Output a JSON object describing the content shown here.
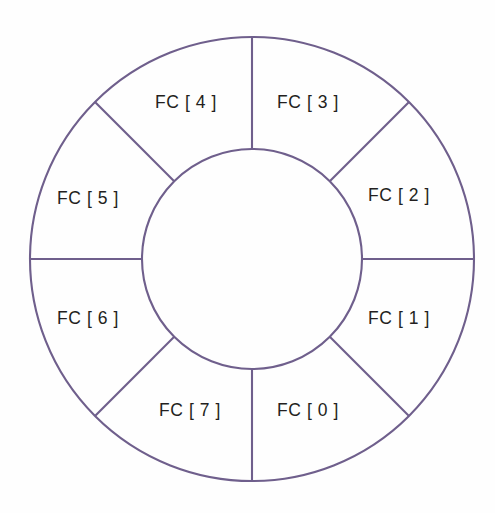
{
  "diagram": {
    "type": "annulus-segments",
    "title": "",
    "background_color": "#fefefe",
    "stroke_color": "#6f5f8c",
    "label_color": "#231f20",
    "outer_radius": 222,
    "inner_radius": 110,
    "center_x": 252,
    "center_y": 259,
    "segment_count": 8,
    "segments": [
      {
        "label": "FC [ 0 ]",
        "index": 0,
        "start_angle_deg": 270,
        "end_angle_deg": 315,
        "label_x": 308,
        "label_y": 411
      },
      {
        "label": "FC [ 1 ]",
        "index": 1,
        "start_angle_deg": 315,
        "end_angle_deg": 360,
        "label_x": 399,
        "label_y": 319
      },
      {
        "label": "FC [ 2 ]",
        "index": 2,
        "start_angle_deg": 0,
        "end_angle_deg": 45,
        "label_x": 399,
        "label_y": 196
      },
      {
        "label": "FC [ 3 ]",
        "index": 3,
        "start_angle_deg": 45,
        "end_angle_deg": 90,
        "label_x": 308,
        "label_y": 103
      },
      {
        "label": "FC [ 4 ]",
        "index": 4,
        "start_angle_deg": 90,
        "end_angle_deg": 135,
        "label_x": 186,
        "label_y": 103
      },
      {
        "label": "FC [ 5 ]",
        "index": 5,
        "start_angle_deg": 135,
        "end_angle_deg": 180,
        "label_x": 88,
        "label_y": 199
      },
      {
        "label": "FC [ 6 ]",
        "index": 6,
        "start_angle_deg": 180,
        "end_angle_deg": 225,
        "label_x": 88,
        "label_y": 319
      },
      {
        "label": "FC [ 7 ]",
        "index": 7,
        "start_angle_deg": 225,
        "end_angle_deg": 270,
        "label_x": 190,
        "label_y": 411
      }
    ],
    "spokes": [
      {
        "name": "spoke-top",
        "angle_deg": 90
      },
      {
        "name": "spoke-upper-left",
        "angle_deg": 135
      },
      {
        "name": "spoke-left",
        "angle_deg": 180
      },
      {
        "name": "spoke-lower-left",
        "angle_deg": 225
      },
      {
        "name": "spoke-bottom",
        "angle_deg": 270
      },
      {
        "name": "spoke-lower-right",
        "angle_deg": 315
      },
      {
        "name": "spoke-right",
        "angle_deg": 0
      },
      {
        "name": "spoke-upper-right",
        "angle_deg": 45
      }
    ]
  }
}
